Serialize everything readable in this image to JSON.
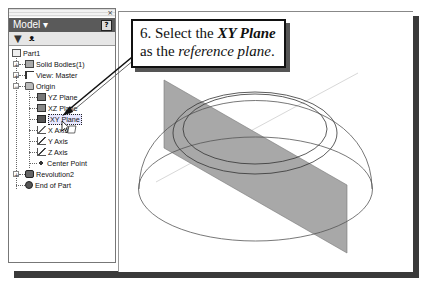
{
  "browser": {
    "close_glyph": "×",
    "title": "Model ▾",
    "help_icon": "?",
    "toolbar": {
      "filter_icon": "filter-icon",
      "find_icon": "binoculars-icon"
    },
    "tree": [
      {
        "label": "Part1",
        "icon": "part-icon",
        "level": 0
      },
      {
        "label": "Solid Bodies(1)",
        "icon": "solid-bodies-icon",
        "level": 1,
        "expandable": true
      },
      {
        "label": "View: Master",
        "icon": "view-icon",
        "level": 1,
        "expandable": true
      },
      {
        "label": "Origin",
        "icon": "folder-icon",
        "level": 1,
        "expandable": true,
        "expanded": true
      },
      {
        "label": "YZ Plane",
        "icon": "plane-icon",
        "level": 2
      },
      {
        "label": "XZ Plane",
        "icon": "plane-icon",
        "level": 2
      },
      {
        "label": "XY Plane",
        "icon": "plane-icon",
        "level": 2,
        "selected": true
      },
      {
        "label": "X Axis",
        "icon": "axis-icon",
        "level": 2
      },
      {
        "label": "Y Axis",
        "icon": "axis-icon",
        "level": 2
      },
      {
        "label": "Z Axis",
        "icon": "axis-icon",
        "level": 2
      },
      {
        "label": "Center Point",
        "icon": "point-icon",
        "level": 2
      },
      {
        "label": "Revolution2",
        "icon": "revolution-icon",
        "level": 1,
        "expandable": true
      },
      {
        "label": "End of Part",
        "icon": "end-of-part-icon",
        "level": 1
      }
    ]
  },
  "callout": {
    "line1_prefix": "6. Select the ",
    "line1_emph": "XY Plane",
    "line2_prefix": "as the ",
    "line2_emph": "reference plane",
    "line2_suffix": "."
  },
  "colors": {
    "panel_title_bg": "#5a5a5a",
    "plane_fill": "#a8a8a8",
    "frame_shadow": "#3a3a3a"
  }
}
